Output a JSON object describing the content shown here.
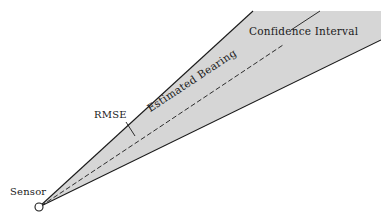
{
  "figure": {
    "type": "bearing-cone-diagram",
    "background_color": "#ffffff",
    "fill_color": "#d6d6d6",
    "line_color": "#1a1a1a",
    "canvas": {
      "width": 381,
      "height": 222
    },
    "sensor_point": {
      "x": 39,
      "y": 207
    },
    "labels": {
      "sensor": "Sensor",
      "rmse": "RMSE",
      "confidence_interval": "Confidence Interval",
      "estimated_bearing": "Estimated Bearing"
    },
    "geometry": {
      "upper_bound_end": {
        "x": 253,
        "y": 11
      },
      "lower_bound_end": {
        "x": 378,
        "y": 39
      },
      "bearing_line_end": {
        "x": 283,
        "y": 45
      },
      "rmse_tick": {
        "x1": 127,
        "y1": 123,
        "x2": 135,
        "y2": 136
      },
      "ci_leader": {
        "x1": 290,
        "y1": 30,
        "x2": 318,
        "y2": 12
      },
      "sensor_marker_radius": 4
    }
  }
}
